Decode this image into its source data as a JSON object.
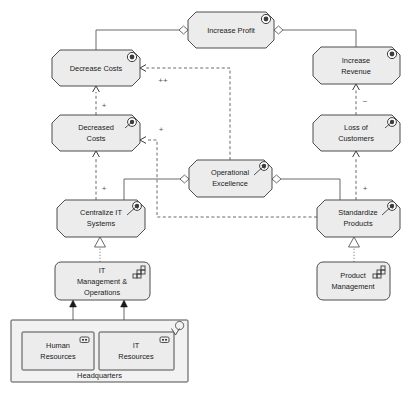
{
  "diagram": {
    "canvas": {
      "width": 413,
      "height": 395,
      "background": "#ffffff"
    },
    "palette": {
      "node_fill": "#ececec",
      "node_stroke": "#4d4d4d",
      "group_fill": "#f2f2f2",
      "edge_color": "#6b6b6b",
      "text_color": "#1a1a1a"
    }
  },
  "nodes": [
    {
      "id": "increase-profit",
      "label_line1": "Increase Profit",
      "label_line2": "",
      "type": "goal",
      "icon": "goal-target-icon",
      "x": 188,
      "y": 12,
      "w": 86,
      "h": 36
    },
    {
      "id": "decrease-costs",
      "label_line1": "Decrease Costs",
      "label_line2": "",
      "type": "goal",
      "icon": "goal-target-icon",
      "x": 52,
      "y": 50,
      "w": 88,
      "h": 36
    },
    {
      "id": "increase-revenue",
      "label_line1": "Increase",
      "label_line2": "Revenue",
      "type": "goal",
      "icon": "goal-target-icon",
      "x": 313,
      "y": 47,
      "w": 87,
      "h": 37
    },
    {
      "id": "decreased-costs",
      "label_line1": "Decreased",
      "label_line2": "Costs",
      "type": "outcome",
      "icon": "outcome-arrow-target-icon",
      "x": 52,
      "y": 115,
      "w": 88,
      "h": 36
    },
    {
      "id": "loss-of-customers",
      "label_line1": "Loss of",
      "label_line2": "Customers",
      "type": "outcome",
      "icon": "outcome-arrow-target-icon",
      "x": 313,
      "y": 115,
      "w": 87,
      "h": 36
    },
    {
      "id": "operational-excellence",
      "label_line1": "Operational",
      "label_line2": "Excellence",
      "type": "outcome",
      "icon": "outcome-arrow-target-icon",
      "x": 189,
      "y": 160,
      "w": 83,
      "h": 37
    },
    {
      "id": "centralize-it-systems",
      "label_line1": "Centralize IT",
      "label_line2": "Systems",
      "type": "outcome",
      "icon": "outcome-arrow-target-icon",
      "x": 57,
      "y": 200,
      "w": 88,
      "h": 37
    },
    {
      "id": "standardize-products",
      "label_line1": "Standardize",
      "label_line2": "Products",
      "type": "outcome",
      "icon": "outcome-arrow-target-icon",
      "x": 317,
      "y": 200,
      "w": 83,
      "h": 37
    },
    {
      "id": "it-management-operations",
      "label_line1": "IT",
      "label_line2": "Management &",
      "label_line3": "Operations",
      "type": "capability",
      "icon": "capability-staircase-icon",
      "x": 55,
      "y": 262,
      "w": 95,
      "h": 38
    },
    {
      "id": "product-management",
      "label_line1": "Product",
      "label_line2": "Management",
      "type": "capability",
      "icon": "capability-staircase-icon",
      "x": 317,
      "y": 262,
      "w": 73,
      "h": 38
    },
    {
      "id": "human-resources",
      "label_line1": "Human",
      "label_line2": "Resources",
      "type": "resource",
      "icon": "resource-battery-icon",
      "x": 22,
      "y": 332,
      "w": 72,
      "h": 38
    },
    {
      "id": "it-resources",
      "label_line1": "IT",
      "label_line2": "Resources",
      "type": "resource",
      "icon": "resource-battery-icon",
      "x": 99,
      "y": 332,
      "w": 75,
      "h": 38
    }
  ],
  "group": {
    "id": "headquarters",
    "label": "Headquarters",
    "type": "location",
    "icon": "location-pin-icon",
    "x": 11,
    "y": 320,
    "w": 177,
    "h": 62
  },
  "edge_labels": [
    {
      "id": "label-plus-plus",
      "text": "++",
      "x": 163,
      "y": 80
    },
    {
      "id": "label-plus-decrease-costs",
      "text": "+",
      "x": 104,
      "y": 105
    },
    {
      "id": "label-plus-decreased-costs-right",
      "text": "+",
      "x": 161,
      "y": 129
    },
    {
      "id": "label-plus-centralize",
      "text": "+",
      "x": 104,
      "y": 188
    },
    {
      "id": "label-minus-revenue",
      "text": "−",
      "x": 365,
      "y": 101
    },
    {
      "id": "label-plus-loss-customers",
      "text": "+",
      "x": 365,
      "y": 188
    }
  ],
  "relations": [
    {
      "id": "rel-aggregation-profit-decrease-costs",
      "kind": "aggregation",
      "from": "increase-profit",
      "to": "decrease-costs"
    },
    {
      "id": "rel-aggregation-profit-increase-revenue",
      "kind": "aggregation",
      "from": "increase-profit",
      "to": "increase-revenue"
    },
    {
      "id": "rel-influence-decreased-to-decrease",
      "kind": "influence",
      "from": "decreased-costs",
      "to": "decrease-costs",
      "modifier": "+"
    },
    {
      "id": "rel-influence-opex-to-decrease-costs",
      "kind": "influence",
      "from": "operational-excellence",
      "to": "decrease-costs",
      "modifier": "++"
    },
    {
      "id": "rel-influence-standardize-to-decreased-costs",
      "kind": "influence",
      "from": "standardize-products",
      "to": "decreased-costs",
      "modifier": "+"
    },
    {
      "id": "rel-influence-centralize-to-decreased-costs",
      "kind": "influence",
      "from": "centralize-it-systems",
      "to": "decreased-costs",
      "modifier": "+"
    },
    {
      "id": "rel-influence-loss-to-revenue",
      "kind": "influence",
      "from": "loss-of-customers",
      "to": "increase-revenue",
      "modifier": "−"
    },
    {
      "id": "rel-influence-standardize-to-loss",
      "kind": "influence",
      "from": "standardize-products",
      "to": "loss-of-customers",
      "modifier": "+"
    },
    {
      "id": "rel-aggregation-opex-centralize",
      "kind": "aggregation",
      "from": "operational-excellence",
      "to": "centralize-it-systems"
    },
    {
      "id": "rel-aggregation-opex-standardize",
      "kind": "aggregation",
      "from": "operational-excellence",
      "to": "standardize-products"
    },
    {
      "id": "rel-realization-itmgmt-centralize",
      "kind": "realization",
      "from": "it-management-operations",
      "to": "centralize-it-systems"
    },
    {
      "id": "rel-realization-prodmgmt-standardize",
      "kind": "realization",
      "from": "product-management",
      "to": "standardize-products"
    },
    {
      "id": "rel-assignment-hr-itmgmt",
      "kind": "assignment",
      "from": "human-resources",
      "to": "it-management-operations"
    },
    {
      "id": "rel-assignment-itres-itmgmt",
      "kind": "assignment",
      "from": "it-resources",
      "to": "it-management-operations"
    }
  ]
}
